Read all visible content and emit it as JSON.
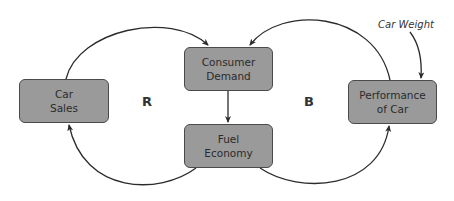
{
  "diagram": {
    "type": "causal-loop-diagram",
    "nodes": {
      "car_sales": {
        "line1": "Car",
        "line2": "Sales"
      },
      "consumer_demand": {
        "line1": "Consumer",
        "line2": "Demand"
      },
      "fuel_economy": {
        "line1": "Fuel",
        "line2": "Economy"
      },
      "performance": {
        "line1": "Performance",
        "line2": "of Car"
      }
    },
    "loops": {
      "reinforcing": "R",
      "balancing": "B"
    },
    "external": {
      "car_weight": "Car Weight"
    },
    "edges": [
      {
        "from": "Car Sales",
        "to": "Consumer Demand"
      },
      {
        "from": "Consumer Demand",
        "to": "Fuel Economy"
      },
      {
        "from": "Fuel Economy",
        "to": "Car Sales"
      },
      {
        "from": "Fuel Economy",
        "to": "Performance of Car"
      },
      {
        "from": "Performance of Car",
        "to": "Consumer Demand"
      },
      {
        "from": "Car Weight",
        "to": "Performance of Car"
      }
    ],
    "colors": {
      "node_fill": "#9a9a9a",
      "node_border": "#4a4a4a",
      "arrow": "#2b2b2b",
      "text": "#2b2b2b"
    }
  }
}
